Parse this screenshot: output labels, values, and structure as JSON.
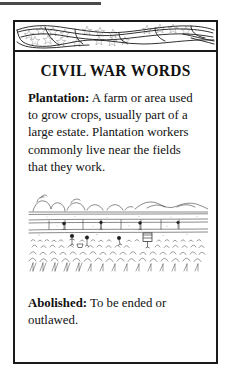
{
  "page": {
    "background_color": "#ffffff",
    "ink_color": "#111111",
    "top_rule": {
      "name": "top-rule",
      "color": "#4a4a4a"
    }
  },
  "card": {
    "border_color": "#1a1a1a",
    "banner": {
      "description": "waving american flag with stars",
      "star_count": 18,
      "stripe_count": 3
    },
    "title": "CIVIL WAR WORDS",
    "entries": [
      {
        "term": "Plantation:",
        "definition": " A farm or area used to grow crops, usually part of a large estate. Plantation workers commonly live near the fields that they work."
      },
      {
        "term": "Abolished:",
        "definition": " To be ended or outlawed."
      }
    ],
    "illustration": {
      "name": "plantation-field-engraving",
      "caption": "",
      "description": "line engraving of a plantation cotton field with distant hills, trees, a fence line and workers picking crops"
    }
  }
}
